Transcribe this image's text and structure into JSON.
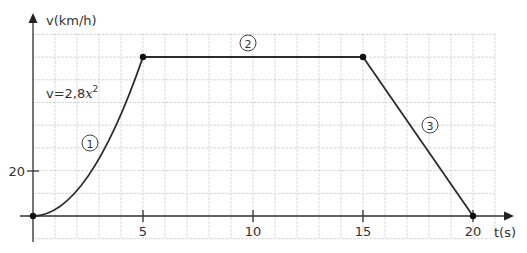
{
  "chart_data": {
    "type": "line",
    "title": "",
    "xlabel": "t(s)",
    "ylabel": "v(km/h)",
    "x_ticks": [
      5,
      10,
      15,
      20
    ],
    "y_ticks": [
      20
    ],
    "xlim": [
      0,
      21
    ],
    "ylim": [
      -1,
      80
    ],
    "grid": true,
    "grid_step": {
      "x": 1,
      "y": 10
    },
    "series": [
      {
        "name": "v(t)",
        "segments": [
          {
            "id": "1",
            "label": "①",
            "kind": "curve",
            "formula": "v=2,8x²",
            "from": [
              0,
              0
            ],
            "to": [
              5,
              70
            ]
          },
          {
            "id": "2",
            "label": "②",
            "kind": "line",
            "from": [
              5,
              70
            ],
            "to": [
              15,
              70
            ]
          },
          {
            "id": "3",
            "label": "③",
            "kind": "line",
            "from": [
              15,
              70
            ],
            "to": [
              20,
              0
            ]
          }
        ],
        "points": [
          [
            0,
            0
          ],
          [
            5,
            70
          ],
          [
            15,
            70
          ],
          [
            20,
            0
          ]
        ]
      }
    ],
    "annotations": [
      {
        "text": "v=2,8x²",
        "near": [
          1.2,
          45
        ]
      },
      {
        "text": "①",
        "near": [
          2.6,
          32
        ]
      },
      {
        "text": "②",
        "near": [
          9.8,
          76
        ]
      },
      {
        "text": "③",
        "near": [
          18.0,
          40
        ]
      }
    ]
  },
  "labels": {
    "y_axis": "v(km/h)",
    "x_axis": "t(s)",
    "formula_prefix": "v=2,8",
    "formula_var": "x",
    "formula_exp": "2",
    "tick_5": "5",
    "tick_10": "10",
    "tick_15": "15",
    "tick_20": "20",
    "ytick_20": "20",
    "seg1": "1",
    "seg2": "2",
    "seg3": "3"
  }
}
